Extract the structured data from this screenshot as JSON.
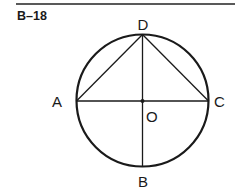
{
  "figure_id": "B–18",
  "points": {
    "A": "A",
    "B": "B",
    "C": "C",
    "D": "D",
    "O": "O"
  },
  "colors": {
    "stroke": "#1a1a1a",
    "background": "#ffffff"
  }
}
